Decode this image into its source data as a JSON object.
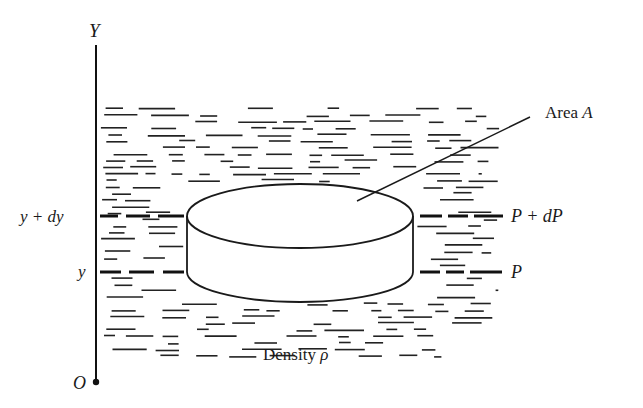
{
  "figure": {
    "axis": {
      "y_label": "Y",
      "origin_label": "O"
    },
    "levels": {
      "upper_left": "y + dy",
      "lower_left": "y",
      "upper_right": "P + dP",
      "lower_right": "P"
    },
    "callout": {
      "area_word": "Area",
      "area_symbol": "A"
    },
    "fluid": {
      "density_word": "Density",
      "density_symbol": "ρ"
    },
    "colors": {
      "ink": "#1a1a1a",
      "background": "#ffffff"
    }
  }
}
